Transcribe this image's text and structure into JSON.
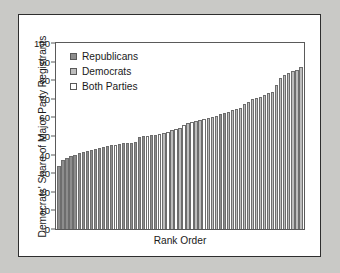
{
  "chart_data": {
    "type": "bar",
    "title": "",
    "xlabel": "Rank Order",
    "ylabel": "Democrats' Share of Major Party Registrants",
    "ylim": [
      0,
      100
    ],
    "yticks": [
      100,
      90,
      80,
      70,
      60,
      50,
      40,
      30,
      20,
      10,
      0
    ],
    "grid": false,
    "legend_position": "top-left",
    "legend": [
      {
        "label": "Republicans",
        "key": "rep",
        "color": "#8d8d8d"
      },
      {
        "label": "Democrats",
        "key": "dem",
        "color": "#bdbdbd"
      },
      {
        "label": "Both Parties",
        "key": "both",
        "color": "#ffffff"
      }
    ],
    "categories_note": "Bars sorted ascending by Democrats' share; each bar is one district.",
    "values": [
      34,
      37,
      38,
      39,
      40,
      41,
      41.5,
      42,
      42.5,
      43,
      43.5,
      44,
      44.5,
      45,
      45,
      45.5,
      46,
      46.5,
      46.5,
      47,
      49.5,
      50,
      50,
      50.5,
      50.5,
      51,
      51.5,
      52,
      53.5,
      54,
      54.5,
      56,
      57,
      57.5,
      58,
      58.5,
      59,
      59.5,
      60,
      61,
      62,
      62.5,
      63,
      64,
      64.5,
      65,
      67,
      68.5,
      70,
      70.5,
      71,
      72,
      73,
      73.5,
      77.5,
      81,
      83,
      84,
      85,
      85.5,
      87
    ],
    "series_keys": [
      "rep",
      "rep",
      "rep",
      "rep",
      "rep",
      "rep",
      "rep",
      "rep",
      "rep",
      "rep",
      "rep",
      "rep",
      "rep",
      "rep",
      "both",
      "rep",
      "rep",
      "rep",
      "rep",
      "rep",
      "rep",
      "rep",
      "both",
      "rep",
      "rep",
      "both",
      "dem",
      "both",
      "dem",
      "both",
      "dem",
      "both",
      "dem",
      "both",
      "dem",
      "dem",
      "both",
      "dem",
      "dem",
      "dem",
      "rep",
      "rep",
      "dem",
      "dem",
      "dem",
      "dem",
      "dem",
      "dem",
      "dem",
      "dem",
      "dem",
      "dem",
      "dem",
      "dem",
      "dem",
      "dem",
      "dem",
      "dem",
      "dem",
      "dem",
      "dem"
    ]
  }
}
